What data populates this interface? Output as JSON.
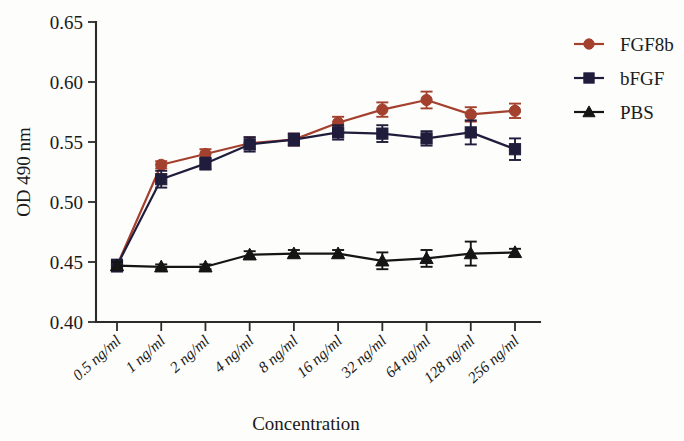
{
  "chart_data": {
    "type": "line",
    "title": "",
    "xlabel": "Concentration",
    "ylabel": "OD 490 nm",
    "categories": [
      "0.5 ng/ml",
      "1 ng/ml",
      "2 ng/ml",
      "4 ng/ml",
      "8 ng/ml",
      "16 ng/ml",
      "32 ng/ml",
      "64 ng/ml",
      "128 ng/ml",
      "256 ng/ml"
    ],
    "ylim": [
      0.4,
      0.65
    ],
    "yticks": [
      0.4,
      0.45,
      0.5,
      0.55,
      0.6,
      0.65
    ],
    "ytick_labels": [
      "0.40",
      "0.45",
      "0.50",
      "0.55",
      "0.60",
      "0.65"
    ],
    "grid": false,
    "legend_position": "right",
    "series": [
      {
        "name": "FGF8b",
        "color": "#a4402e",
        "marker": "circle",
        "values": [
          0.447,
          0.531,
          0.54,
          0.549,
          0.552,
          0.566,
          0.577,
          0.585,
          0.573,
          0.576
        ],
        "errors": [
          0.004,
          0.003,
          0.004,
          0.005,
          0.005,
          0.005,
          0.006,
          0.007,
          0.006,
          0.006
        ]
      },
      {
        "name": "bFGF",
        "color": "#201d3c",
        "marker": "square",
        "values": [
          0.447,
          0.519,
          0.532,
          0.548,
          0.552,
          0.558,
          0.557,
          0.553,
          0.558,
          0.544
        ],
        "errors": [
          0.005,
          0.007,
          0.005,
          0.006,
          0.005,
          0.006,
          0.007,
          0.006,
          0.01,
          0.009
        ]
      },
      {
        "name": "PBS",
        "color": "#151515",
        "marker": "triangle",
        "values": [
          0.447,
          0.446,
          0.446,
          0.456,
          0.457,
          0.457,
          0.451,
          0.453,
          0.457,
          0.458
        ],
        "errors": [
          0.003,
          0.002,
          0.002,
          0.003,
          0.003,
          0.003,
          0.007,
          0.007,
          0.01,
          0.003
        ]
      }
    ]
  },
  "axes": {
    "y_axis_label": "OD 490 nm",
    "x_axis_label": "Concentration"
  },
  "legend": {
    "items": [
      {
        "label": "FGF8b"
      },
      {
        "label": "bFGF"
      },
      {
        "label": "PBS"
      }
    ]
  }
}
